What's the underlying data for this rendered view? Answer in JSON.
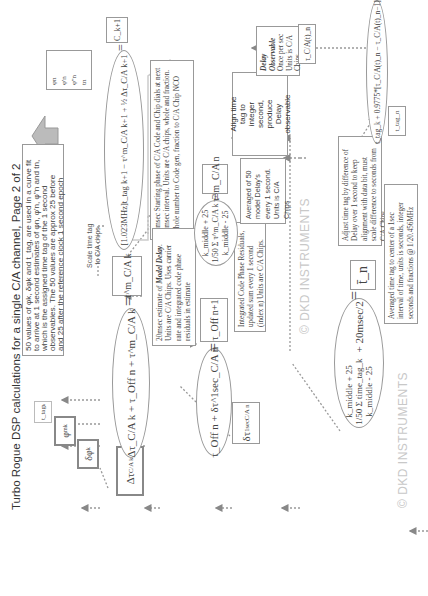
{
  "title": "Turbo Rogue DSP calculations for a single C/A channel, Page 2 of 2",
  "watermarks": [
    "© DKD INSTRUMENTS",
    "© DKD INSTRUMENTS"
  ],
  "inputs": {
    "t_tag": "t_tag",
    "t_tag_sub": "k",
    "phi": "φ",
    "phi_sup": "m",
    "phi_sub": "k",
    "dphi": "δφ",
    "dphi_sub": "k",
    "delta_tau": "Δτ",
    "delta_tau_sub": "C/A k",
    "dtau_1sec": "δτ",
    "dtau_1sec_sup": "1sec",
    "dtau_1sec_sub": "C/A n"
  },
  "curve_fit_note": {
    "lines": [
      "50 values of φk, δφk and t_tag, are used in a curve fit",
      "to arrive at 1 second estimates of φn, φ'n, φ''n and tn,",
      "which is the assigned time tag of the 1 second",
      "observables. The 50 values are approx 25 before",
      "and 25 after the reference clock 1 second epoch"
    ]
  },
  "outputs_box": {
    "lines": [
      "φn",
      "φ'n",
      "φ''n",
      "tn"
    ]
  },
  "eq_model_delay": {
    "lhs": "Δτ_C/A k + τ_Off n + τ^m_C/A k",
    "equals": "=",
    "result": "τ^m_C/A k"
  },
  "eq_scale_time": {
    "label_line1": "Scale time tag",
    "label_line2": "to C/A chips",
    "expr": "[1.023MHz]t_tag k+1 − τ^m_C/A k+1 + ½ Δτ_C/A k+1",
    "equals": "=",
    "result": "C_k+1"
  },
  "note_starting_phase": {
    "text": "20msec Starting phase of C/A Code and Chip dials at next 20msec interval. Units are C/A chips, whole and fraction. Whole number to Code gen, fraction to C/A Chip NCO"
  },
  "note_model_delay": {
    "text_pre": "20msec estimate of ",
    "text_em": "Model Delay",
    "text_post": ". Units are C/A Chips. Uses carrier rate and integrated code phase residuals in estimate"
  },
  "eq_offset": {
    "expr": "τ_Off n + δτ^1sec_C/A n",
    "equals": "=",
    "result": "τ_Off n+1"
  },
  "note_integrated": {
    "text": "Integrated Code Phase Residuals, updated sum every 1 second (index n) Units are C/A Chips."
  },
  "eq_average_delay": {
    "upper": "k_middle + 25",
    "prefix": "1/50",
    "summand": "τ^m_C/A k",
    "lower": "k_middle - 25",
    "equals": "=",
    "result": "τ̄^m_C/A n"
  },
  "note_averaged_delay": {
    "text": "Averaged of 50 model Delay's every 1 second. Units is C/A Chips"
  },
  "align_box": {
    "lines": [
      "Align time",
      "tag to",
      "integer",
      "second,",
      "produce",
      "Delay",
      "observable"
    ]
  },
  "delay_observable_note": {
    "title1": "Delay",
    "title2": "Observable",
    "lines": [
      "Once per sec",
      "Units is C/A",
      "Chips"
    ]
  },
  "tau_ca_box": {
    "text": "τ_C/A(t)_n"
  },
  "eq_time_tag": {
    "upper": "k_middle + 25",
    "prefix": "1/50",
    "summand": "time_tag_k",
    "lower": "k_middle - 25",
    "plus": "+ 20msec/2",
    "equals": "=",
    "result": "t̄_n"
  },
  "note_adjust": {
    "text": "Adjust time tag by difference of Delay over 1 second to keep alignment with data bit, must scale difference to seconds from C/A Chips"
  },
  "note_averaged_time": {
    "text": "Averaged time tag to center of a 1sec interval of time, units is seconds, integer seconds and fractions @ 1/20.456MHz"
  },
  "t_tag_n_box": {
    "text": "t_tag_n"
  },
  "eq_final": {
    "expr": "t_tag_k + 0.9775*[τ_C/A(t)_n − τ_C/A(t)_n−1]"
  },
  "colors": {
    "line": "#999999",
    "arrow": "#888888",
    "fat_arrow": "#aaaaaa",
    "watermark": "#c8c8c8"
  }
}
